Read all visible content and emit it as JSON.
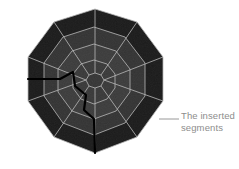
{
  "figure": {
    "type": "3d-mesh-render",
    "background_color": "#ffffff",
    "mesh": {
      "outline_sides": 10,
      "center": {
        "x": 95,
        "y": 81
      },
      "outer_radius": 72,
      "rings": [
        {
          "name": "outer-ring",
          "radius": 72,
          "fill": "#161616"
        },
        {
          "name": "ring-3",
          "radius": 54,
          "fill": "#343434"
        },
        {
          "name": "ring-2",
          "radius": 38,
          "fill": "#3d3d3d"
        },
        {
          "name": "ring-1",
          "radius": 22,
          "fill": "#3a3a3a"
        },
        {
          "name": "hub",
          "radius": 9,
          "fill": "#383838"
        }
      ],
      "wireframe_color": "#b9b9b9",
      "wireframe_width": 0.8,
      "rotation_deg": -9,
      "inserted_seam": {
        "color": "#000000",
        "width": 2.2,
        "description": "thick black polyline entering from the left edge, stepping toward the centre then descending to the bottom rim"
      }
    },
    "annotation": {
      "text": "The inserted\nsegments",
      "line1": "The inserted",
      "line2": "segments",
      "text_color": "#8d8d8d",
      "leader_line": {
        "color": "#8d8d8d",
        "from": {
          "x": 159,
          "y": 119
        },
        "to": {
          "x": 179,
          "y": 119
        }
      }
    }
  }
}
